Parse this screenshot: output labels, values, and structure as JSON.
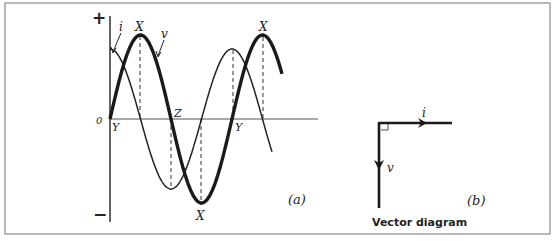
{
  "figure": {
    "panel_a": {
      "caption": "(a)",
      "axis_labels": {
        "plus": "+",
        "minus": "−",
        "origin": "0"
      },
      "curve_labels": {
        "current": "i",
        "voltage": "v"
      },
      "point_labels": {
        "v_peak_1": "X",
        "v_peak_2": "X",
        "v_trough": "X",
        "origin_y": "Y",
        "second_y": "Y",
        "zero_z": "Z"
      }
    },
    "panel_b": {
      "caption": "(b)",
      "title": "Vector diagram",
      "vector_labels": {
        "current": "i",
        "voltage": "v"
      }
    }
  },
  "colors": {
    "ink": "#222222",
    "frame": "#888888",
    "background": "#ffffff"
  }
}
